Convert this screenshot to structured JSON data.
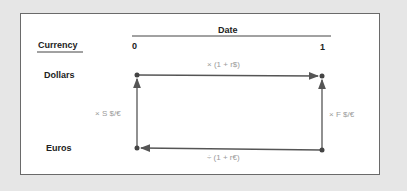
{
  "header": {
    "date_label": "Date",
    "currency_label": "Currency",
    "date0": "0",
    "date1": "1"
  },
  "rows": {
    "dollars": "Dollars",
    "euros": "Euros"
  },
  "arrows": {
    "top": "× (1 + r$)",
    "bottom": "÷ (1 + r€)",
    "left": "× S $/€",
    "right": "× F $/€"
  },
  "colors": {
    "line": "#555555",
    "label": "#9a9a9a",
    "background": "#e6e6e6",
    "frame": "#6a6a6a"
  }
}
